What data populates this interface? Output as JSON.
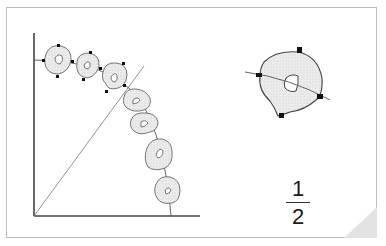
{
  "figure": {
    "fraction": {
      "numerator": "1",
      "denominator": "2"
    },
    "colors": {
      "frame_border": "#bdbdbd",
      "stroke": "#555555",
      "fill": "#e8e8e8",
      "marker": "#111111",
      "page_curl": "#e6e6e6"
    },
    "sequence_shape_count": 7,
    "enlarged_shape_markers": 4
  }
}
